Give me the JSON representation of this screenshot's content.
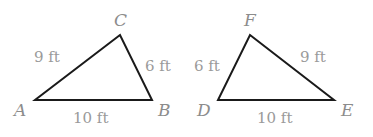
{
  "diagram": {
    "background": "#ffffff",
    "line_color": "#1a1a1a",
    "label_color": "#9a9a9a",
    "triangles": [
      {
        "name": "triangle-ABC",
        "vertices": {
          "A": [
            35,
            100
          ],
          "B": [
            152,
            100
          ],
          "C": [
            120,
            35
          ]
        },
        "vertex_labels": {
          "A": "A",
          "B": "B",
          "C": "C"
        },
        "sides": {
          "AC": "9 ft",
          "CB": "6 ft",
          "AB": "10 ft"
        }
      },
      {
        "name": "triangle-DEF",
        "vertices": {
          "D": [
            218,
            100
          ],
          "E": [
            334,
            100
          ],
          "F": [
            250,
            35
          ]
        },
        "vertex_labels": {
          "D": "D",
          "E": "E",
          "F": "F"
        },
        "sides": {
          "DF": "6 ft",
          "FE": "9 ft",
          "DE": "10 ft"
        }
      }
    ]
  }
}
